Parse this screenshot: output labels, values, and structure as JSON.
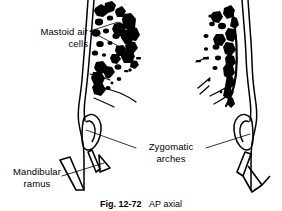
{
  "figure": {
    "domain_kind": "anatomical-line-drawing",
    "background_color": "#ffffff",
    "ink_color": "#000000",
    "width": 282,
    "height": 211,
    "caption": {
      "number": "Fig. 12-72",
      "text": "AP axial",
      "full": "Fig. 12-72   AP axial",
      "clipped_at_bottom": true
    },
    "labels": [
      {
        "id": "mastoid-air-cells",
        "line1": "Mastoid air",
        "line2": "cells",
        "full": "Mastoid air cells",
        "align": "right",
        "leader_count": 2
      },
      {
        "id": "zygomatic-arches",
        "line1": "Zygomatic",
        "line2": "arches",
        "full": "Zygomatic arches",
        "align": "center",
        "leader_count": 2
      },
      {
        "id": "mandibular-ramus",
        "line1": "Mandibular",
        "line2": "ramus",
        "full": "Mandibular ramus",
        "align": "center",
        "leader_count": 1
      }
    ],
    "structures": [
      {
        "id": "left-skull-outline",
        "side": "left"
      },
      {
        "id": "right-skull-outline",
        "side": "right"
      },
      {
        "id": "left-mastoid-air-cells",
        "side": "left"
      },
      {
        "id": "right-mastoid-air-cells",
        "side": "right"
      },
      {
        "id": "left-zygomatic-arch",
        "side": "left"
      },
      {
        "id": "right-zygomatic-arch",
        "side": "right"
      },
      {
        "id": "left-mandibular-ramus",
        "side": "left"
      },
      {
        "id": "right-mandibular-ramus",
        "side": "right"
      }
    ]
  }
}
